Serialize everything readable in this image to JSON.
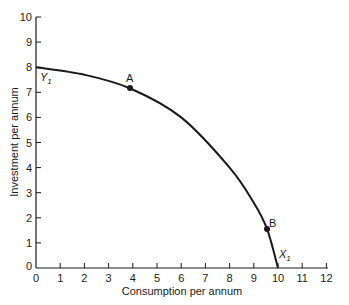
{
  "chart_data": {
    "type": "line",
    "title": "",
    "xlabel": "Consumption per annum",
    "ylabel": "Investment per annum",
    "xlim": [
      0,
      12
    ],
    "ylim": [
      0,
      10
    ],
    "grid": false,
    "legend": null,
    "x_ticks": [
      "0",
      "1",
      "2",
      "3",
      "4",
      "5",
      "6",
      "7",
      "8",
      "9",
      "10",
      "11",
      "12"
    ],
    "y_ticks": [
      "0",
      "1",
      "2",
      "3",
      "4",
      "5",
      "6",
      "7",
      "8",
      "9",
      "10"
    ],
    "series": [
      {
        "name": "Production possibility frontier",
        "x": [
          0,
          2,
          3.9,
          6,
          8,
          9,
          9.55,
          10
        ],
        "y": [
          8,
          7.7,
          7.15,
          6.0,
          4.0,
          2.6,
          1.55,
          0
        ]
      }
    ],
    "points": [
      {
        "label": "A",
        "x": 3.9,
        "y": 7.15
      },
      {
        "label": "B",
        "x": 9.55,
        "y": 1.55
      }
    ],
    "annotations": [
      {
        "text": "Y",
        "subscript": "1",
        "x": 0,
        "y": 8
      },
      {
        "text": "X",
        "subscript": "1",
        "x": 10,
        "y": 0
      }
    ]
  },
  "labels": {
    "xlabel": "Consumption per annum",
    "ylabel": "Investment per annum",
    "point_a": "A",
    "point_b": "B",
    "y1_main": "Y",
    "y1_sub": "1",
    "x1_main": "X",
    "x1_sub": "1"
  }
}
